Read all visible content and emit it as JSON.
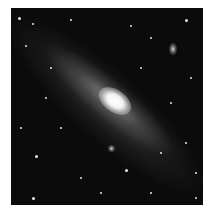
{
  "image": {
    "subject": "spiral galaxy with satellite galaxies and star field",
    "palette": {
      "background": "#0b0b0b",
      "core": "#ffffff",
      "frame": "#ffffff"
    },
    "satellites": [
      {
        "name": "upper-right-satellite",
        "x": 162,
        "y": 41,
        "w": 8,
        "h": 12
      },
      {
        "name": "lower-satellite",
        "x": 100,
        "y": 140,
        "w": 7,
        "h": 7
      }
    ],
    "stars": [
      {
        "x": 8,
        "y": 10,
        "r": 1.5
      },
      {
        "x": 22,
        "y": 16,
        "r": 1
      },
      {
        "x": 15,
        "y": 38,
        "r": 1
      },
      {
        "x": 40,
        "y": 60,
        "r": 1
      },
      {
        "x": 60,
        "y": 12,
        "r": 1
      },
      {
        "x": 120,
        "y": 18,
        "r": 1
      },
      {
        "x": 175,
        "y": 12,
        "r": 1.5
      },
      {
        "x": 140,
        "y": 30,
        "r": 1
      },
      {
        "x": 180,
        "y": 70,
        "r": 1
      },
      {
        "x": 160,
        "y": 95,
        "r": 1
      },
      {
        "x": 25,
        "y": 148,
        "r": 1.5
      },
      {
        "x": 115,
        "y": 162,
        "r": 1.5
      },
      {
        "x": 50,
        "y": 120,
        "r": 1
      },
      {
        "x": 70,
        "y": 170,
        "r": 1
      },
      {
        "x": 185,
        "y": 165,
        "r": 1
      },
      {
        "x": 22,
        "y": 190,
        "r": 1.5
      },
      {
        "x": 140,
        "y": 185,
        "r": 1
      },
      {
        "x": 175,
        "y": 135,
        "r": 1
      },
      {
        "x": 35,
        "y": 90,
        "r": 1
      },
      {
        "x": 150,
        "y": 145,
        "r": 1
      },
      {
        "x": 90,
        "y": 185,
        "r": 1
      },
      {
        "x": 10,
        "y": 120,
        "r": 1
      },
      {
        "x": 130,
        "y": 60,
        "r": 1
      },
      {
        "x": 185,
        "y": 190,
        "r": 1
      }
    ]
  }
}
